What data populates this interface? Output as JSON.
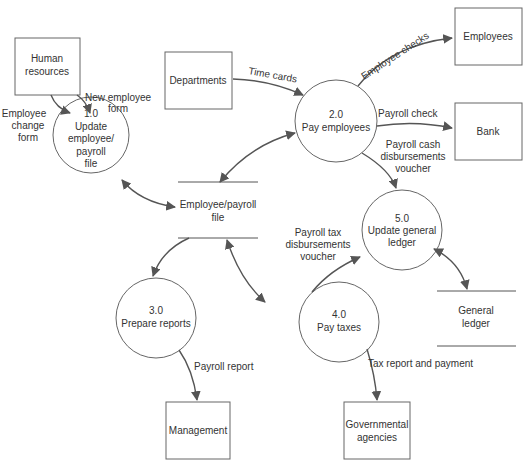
{
  "diagram": {
    "colors": {
      "line": "#555555",
      "shape_border": "#666666",
      "text": "#333333",
      "background": "#ffffff"
    },
    "external_entities": {
      "human_resources": {
        "lines": [
          "Human",
          "resources"
        ]
      },
      "departments": {
        "lines": [
          "Departments"
        ]
      },
      "employees": {
        "lines": [
          "Employees"
        ]
      },
      "bank": {
        "lines": [
          "Bank"
        ]
      },
      "management": {
        "lines": [
          "Management"
        ]
      },
      "governmental_agencies": {
        "lines": [
          "Governmental",
          "agencies"
        ]
      }
    },
    "processes": {
      "p1": {
        "number": "1.0",
        "lines": [
          "Update",
          "employee/",
          "payroll",
          "file"
        ]
      },
      "p2": {
        "number": "2.0",
        "lines": [
          "Pay employees"
        ]
      },
      "p3": {
        "number": "3.0",
        "lines": [
          "Prepare reports"
        ]
      },
      "p4": {
        "number": "4.0",
        "lines": [
          "Pay taxes"
        ]
      },
      "p5": {
        "number": "5.0",
        "lines": [
          "Update general",
          "ledger"
        ]
      }
    },
    "data_stores": {
      "employee_payroll_file": {
        "lines": [
          "Employee/payroll",
          "file"
        ]
      },
      "general_ledger": {
        "lines": [
          "General",
          "ledger"
        ]
      }
    },
    "flows": {
      "new_employee_form": {
        "lines": [
          "New employee",
          "form"
        ]
      },
      "employee_change_form": {
        "lines": [
          "Employee",
          "change",
          "form"
        ]
      },
      "time_cards": {
        "lines": [
          "Time cards"
        ]
      },
      "employee_checks": {
        "lines": [
          "Employee checks"
        ]
      },
      "payroll_check": {
        "lines": [
          "Payroll check"
        ]
      },
      "payroll_cash_voucher": {
        "lines": [
          "Payroll cash",
          "disbursements",
          "voucher"
        ]
      },
      "payroll_tax_voucher": {
        "lines": [
          "Payroll tax",
          "disbursements",
          "voucher"
        ]
      },
      "payroll_report": {
        "lines": [
          "Payroll report"
        ]
      },
      "tax_report_payment": {
        "lines": [
          "Tax report and payment"
        ]
      }
    }
  }
}
